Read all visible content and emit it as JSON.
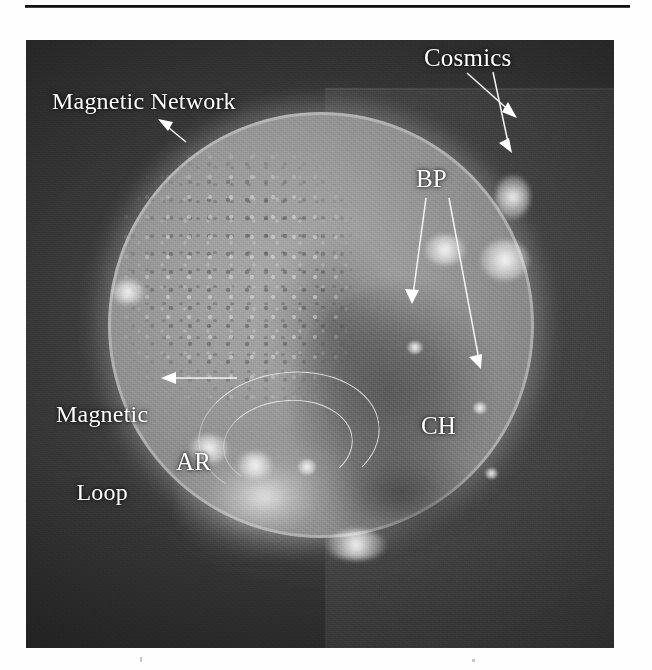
{
  "figure": {
    "type": "solar-euv-image",
    "background_color": "#3a3a3a",
    "annotation_color": "#ffffff",
    "rule_color": "#111111"
  },
  "annotations": {
    "cosmics": {
      "label": "Cosmics",
      "arrow_count": 2
    },
    "magnetic_network": {
      "label": "Magnetic Network",
      "arrow_count": 1
    },
    "bp": {
      "label": "BP",
      "arrow_count": 2
    },
    "magnetic_loop": {
      "label_line1": "Magnetic",
      "label_line2": "Loop",
      "arrow_count": 1
    },
    "ar": {
      "label": "AR",
      "arrow_count": 0
    },
    "ch": {
      "label": "CH",
      "arrow_count": 0
    }
  }
}
